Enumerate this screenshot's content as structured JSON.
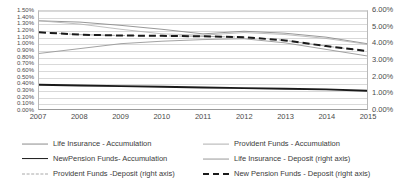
{
  "chart_data": {
    "type": "line",
    "title": "",
    "xlabel": "",
    "ylabel": "",
    "grid": true,
    "legend_position": "bottom",
    "categories": [
      "2007",
      "2008",
      "2009",
      "2010",
      "2011",
      "2012",
      "2013",
      "2014",
      "2015"
    ],
    "x": [
      2007,
      2008,
      2009,
      2010,
      2011,
      2012,
      2013,
      2014,
      2015
    ],
    "left_axis": {
      "label": "",
      "ylim": [
        0.0,
        1.5
      ],
      "tick_step": 0.1,
      "ticks": [
        "1.50%",
        "1.40%",
        "1.30%",
        "1.20%",
        "1.10%",
        "1.00%",
        "0.90%",
        "0.80%",
        "0.70%",
        "0.60%",
        "0.50%",
        "0.40%",
        "0.30%",
        "0.20%",
        "0.10%",
        "0.00%"
      ],
      "tick_values": [
        1.5,
        1.4,
        1.3,
        1.2,
        1.1,
        1.0,
        0.9,
        0.8,
        0.7,
        0.6,
        0.5,
        0.4,
        0.3,
        0.2,
        0.1,
        0.0
      ]
    },
    "right_axis": {
      "label": "",
      "ylim": [
        0.0,
        6.0
      ],
      "tick_step": 1.0,
      "ticks": [
        "6.00%",
        "5.00%",
        "4.00%",
        "3.00%",
        "2.00%",
        "1.00%",
        "0.00%"
      ],
      "tick_values": [
        6.0,
        5.0,
        4.0,
        3.0,
        2.0,
        1.0,
        0.0
      ]
    },
    "series": [
      {
        "name": "Life Insurance - Accumulation",
        "axis": "left",
        "style": "solid-thin",
        "color": "#8c8c8c",
        "values": [
          1.35,
          1.33,
          1.28,
          1.22,
          1.15,
          1.19,
          1.16,
          1.1,
          1.0
        ]
      },
      {
        "name": "NewPension Funds- Accumulation",
        "axis": "left",
        "style": "solid-thick",
        "color": "#1a1a1a",
        "values": [
          0.37,
          0.36,
          0.35,
          0.34,
          0.33,
          0.32,
          0.31,
          0.3,
          0.28
        ]
      },
      {
        "name": "Provident Funds -Deposit  (right axis)",
        "axis": "right",
        "style": "dashed-thin",
        "color": "#a8a8a8",
        "values": [
          4.7,
          4.55,
          4.5,
          4.48,
          4.45,
          4.4,
          4.2,
          3.85,
          3.55
        ]
      },
      {
        "name": "Provident Funds - Accumulation",
        "axis": "left",
        "style": "solid-light",
        "color": "#b0b0b0",
        "values": [
          1.35,
          1.3,
          1.22,
          1.15,
          1.13,
          1.17,
          1.14,
          1.08,
          0.99
        ]
      },
      {
        "name": "Life Insurance - Deposit (right axis)",
        "axis": "right",
        "style": "solid-mid",
        "color": "#999999",
        "values": [
          3.4,
          3.7,
          4.0,
          4.15,
          4.25,
          4.3,
          4.05,
          3.65,
          3.25
        ]
      },
      {
        "name": "New Pension Funds - Deposit (right axis)",
        "axis": "right",
        "style": "dashed-thick",
        "color": "#1a1a1a",
        "values": [
          4.7,
          4.55,
          4.5,
          4.48,
          4.45,
          4.4,
          4.2,
          3.85,
          3.55
        ]
      }
    ]
  },
  "legend": {
    "left_column": [
      {
        "label": "Life Insurance - Accumulation",
        "style": "solid-thin",
        "color": "#8c8c8c"
      },
      {
        "label": "NewPension Funds- Accumulation",
        "style": "solid-thick",
        "color": "#1a1a1a"
      },
      {
        "label": "Provident Funds -Deposit  (right axis)",
        "style": "dashed-thin",
        "color": "#a8a8a8"
      }
    ],
    "right_column": [
      {
        "label": "Provident Funds - Accumulation",
        "style": "solid-light",
        "color": "#b0b0b0"
      },
      {
        "label": "Life Insurance - Deposit (right axis)",
        "style": "solid-mid",
        "color": "#999999"
      },
      {
        "label": "New Pension Funds - Deposit (right axis)",
        "style": "dashed-thick",
        "color": "#1a1a1a"
      }
    ]
  }
}
